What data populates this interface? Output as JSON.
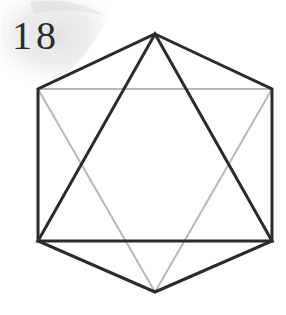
{
  "figure": {
    "label": "18",
    "caption_position": "top-left",
    "background_color": "#ffffff",
    "width": 286,
    "height": 315
  },
  "watermark": {
    "name": "faint-gray-blob",
    "color": "#e9e9ea",
    "opacity": 0.9,
    "description": "faint light gray smudge behind the figure number in the upper-left corner"
  },
  "chart_data": {
    "type": "diagram",
    "title": "18",
    "subtitle": "",
    "xlabel": "",
    "ylabel": "",
    "colors": {
      "hexagon_stroke": "#2b2b2b",
      "dark_triangle_stroke": "#2b2b2b",
      "light_triangle_stroke": "#b8b8b8"
    },
    "stroke_widths": {
      "hexagon": 3,
      "dark_triangle": 3,
      "light_triangle": 2
    },
    "vertices": {
      "top": [
        155,
        34
      ],
      "upper_right": [
        272,
        89
      ],
      "lower_right": [
        272,
        241
      ],
      "bottom": [
        155,
        292
      ],
      "lower_left": [
        38,
        241
      ],
      "upper_left": [
        38,
        89
      ]
    },
    "shapes": [
      {
        "name": "hexagon-outline",
        "kind": "polygon",
        "stroke": "#2b2b2b",
        "fill": "none",
        "stroke_width": 3,
        "points": [
          [
            155,
            34
          ],
          [
            272,
            89
          ],
          [
            272,
            241
          ],
          [
            155,
            292
          ],
          [
            38,
            241
          ],
          [
            38,
            89
          ]
        ],
        "edges": [
          {
            "name": "top-left-edge",
            "from": "top",
            "to": "upper_left",
            "shade": "dark"
          },
          {
            "name": "top-right-edge",
            "from": "top",
            "to": "upper_right",
            "shade": "dark"
          },
          {
            "name": "right-edge",
            "from": "upper_right",
            "to": "lower_right",
            "shade": "dark"
          },
          {
            "name": "bottom-right-edge",
            "from": "lower_right",
            "to": "bottom",
            "shade": "dark"
          },
          {
            "name": "bottom-left-edge",
            "from": "bottom",
            "to": "lower_left",
            "shade": "dark"
          },
          {
            "name": "left-edge",
            "from": "lower_left",
            "to": "upper_left",
            "shade": "dark"
          }
        ]
      },
      {
        "name": "dark-triangle",
        "kind": "polygon",
        "stroke": "#2b2b2b",
        "fill": "none",
        "stroke_width": 3,
        "orientation": "apex-up",
        "points": [
          [
            155,
            34
          ],
          [
            272,
            241
          ],
          [
            38,
            241
          ]
        ]
      },
      {
        "name": "light-triangle",
        "kind": "polygon",
        "stroke": "#b8b8b8",
        "fill": "none",
        "stroke_width": 2,
        "orientation": "apex-down",
        "points": [
          [
            38,
            89
          ],
          [
            272,
            89
          ],
          [
            155,
            292
          ]
        ]
      }
    ],
    "legend": [],
    "grid": false
  }
}
